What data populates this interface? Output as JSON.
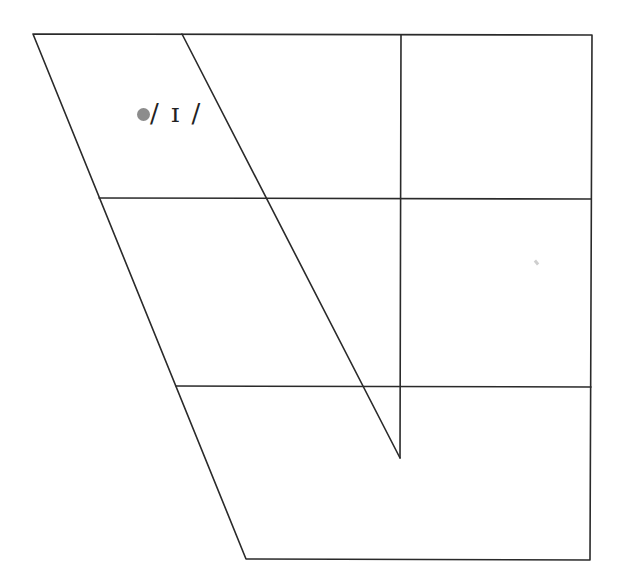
{
  "diagram": {
    "type": "vowel-trapezoid",
    "vowels": [
      {
        "symbol": "ɪ",
        "label": "/ ɪ /",
        "marker_color": "#8c8c8c",
        "position": "near-close near-front"
      }
    ],
    "line_color": "#2a2a2a"
  }
}
